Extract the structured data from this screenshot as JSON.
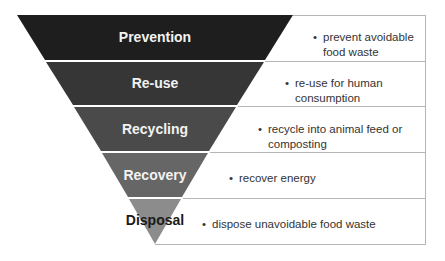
{
  "diagram": {
    "type": "inverted-pyramid",
    "title": "",
    "levels": [
      {
        "label": "Prevention",
        "description_lines": [
          "prevent avoidable",
          "food waste"
        ],
        "color": "#1e1e1e",
        "text_color": "#e8e8e8"
      },
      {
        "label": "Re-use",
        "description_lines": [
          "re-use for human",
          "consumption"
        ],
        "color": "#363636",
        "text_color": "#e8e8e8"
      },
      {
        "label": "Recycling",
        "description_lines": [
          "recycle into animal feed or",
          "composting"
        ],
        "color": "#4a4a4a",
        "text_color": "#e8e8e8"
      },
      {
        "label": "Recovery",
        "description_lines": [
          "recover energy"
        ],
        "color": "#666666",
        "text_color": "#e8e8e8"
      },
      {
        "label": "Disposal",
        "description_lines": [
          "dispose unavoidable food waste"
        ],
        "color": "#8c8c8c",
        "text_color": "#1a1a1a"
      }
    ],
    "bullet": "•",
    "line_color": "#b0b0b0"
  }
}
